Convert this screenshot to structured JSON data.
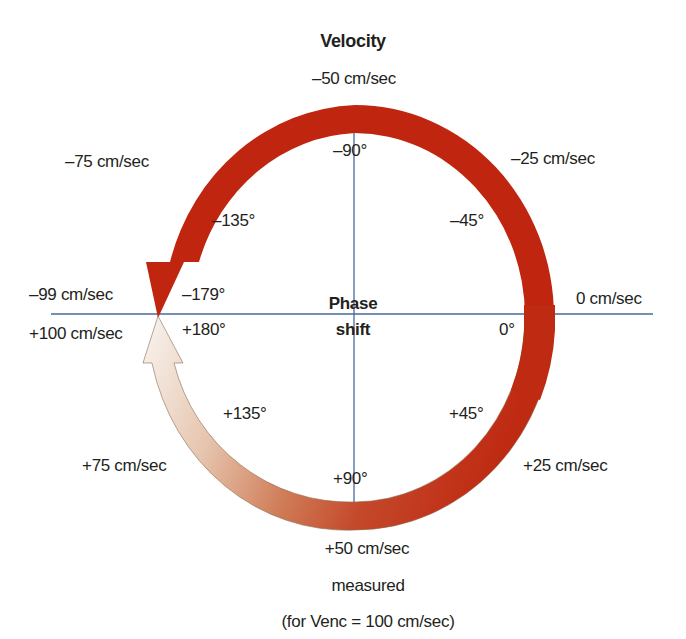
{
  "title": "Velocity",
  "center_label": {
    "line1": "Phase",
    "line2": "shift"
  },
  "footer": {
    "line1": "measured",
    "line2": "(for Venc = 100 cm/sec)"
  },
  "velocity_labels": {
    "v_0": "0 cm/sec",
    "v_neg25": "–25 cm/sec",
    "v_neg50": "–50 cm/sec",
    "v_neg75": "–75 cm/sec",
    "v_neg99": "–99 cm/sec",
    "v_pos100": "+100 cm/sec",
    "v_pos75": "+75 cm/sec",
    "v_pos50": "+50 cm/sec",
    "v_pos25": "+25 cm/sec"
  },
  "phase_labels": {
    "p_0": "0°",
    "p_neg45": "–45°",
    "p_neg90": "–90°",
    "p_neg135": "–135°",
    "p_neg179": "–179°",
    "p_pos180": "+180°",
    "p_pos135": "+135°",
    "p_pos90": "+90°",
    "p_pos45": "+45°"
  },
  "colors": {
    "arc_red": "#c0260f",
    "arc_gradient_mid": "#c85a34",
    "arc_gradient_light": "#f6efe8",
    "axis_line": "#4a6a9a",
    "text": "#231f20"
  }
}
